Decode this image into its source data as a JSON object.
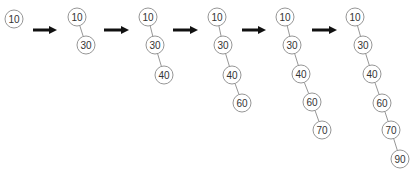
{
  "diagram": {
    "colors": {
      "node_stroke": "#8a8a8a",
      "node_text": "#333333",
      "arrow": "#111111"
    },
    "node_radius": 9,
    "trees": [
      {
        "nodes": [
          {
            "value": "10",
            "x": 14,
            "y": 19
          }
        ]
      },
      {
        "nodes": [
          {
            "value": "10",
            "x": 77,
            "y": 17
          },
          {
            "value": "30",
            "x": 86,
            "y": 45
          }
        ]
      },
      {
        "nodes": [
          {
            "value": "10",
            "x": 148,
            "y": 17
          },
          {
            "value": "30",
            "x": 155,
            "y": 45
          },
          {
            "value": "40",
            "x": 164,
            "y": 75
          }
        ]
      },
      {
        "nodes": [
          {
            "value": "10",
            "x": 217,
            "y": 17
          },
          {
            "value": "30",
            "x": 223,
            "y": 45
          },
          {
            "value": "40",
            "x": 232,
            "y": 75
          },
          {
            "value": "60",
            "x": 242,
            "y": 103
          }
        ]
      },
      {
        "nodes": [
          {
            "value": "10",
            "x": 285,
            "y": 17
          },
          {
            "value": "30",
            "x": 292,
            "y": 45
          },
          {
            "value": "40",
            "x": 301,
            "y": 74
          },
          {
            "value": "60",
            "x": 312,
            "y": 102
          },
          {
            "value": "70",
            "x": 322,
            "y": 130
          }
        ]
      },
      {
        "nodes": [
          {
            "value": "10",
            "x": 355,
            "y": 17
          },
          {
            "value": "30",
            "x": 363,
            "y": 45
          },
          {
            "value": "40",
            "x": 372,
            "y": 74
          },
          {
            "value": "60",
            "x": 382,
            "y": 103
          },
          {
            "value": "70",
            "x": 391,
            "y": 130
          },
          {
            "value": "90",
            "x": 400,
            "y": 159
          }
        ]
      }
    ],
    "arrows": [
      {
        "x1": 33,
        "x2": 57,
        "y": 30
      },
      {
        "x1": 104,
        "x2": 129,
        "y": 30
      },
      {
        "x1": 173,
        "x2": 198,
        "y": 30
      },
      {
        "x1": 242,
        "x2": 266,
        "y": 30
      },
      {
        "x1": 312,
        "x2": 337,
        "y": 30
      }
    ]
  }
}
